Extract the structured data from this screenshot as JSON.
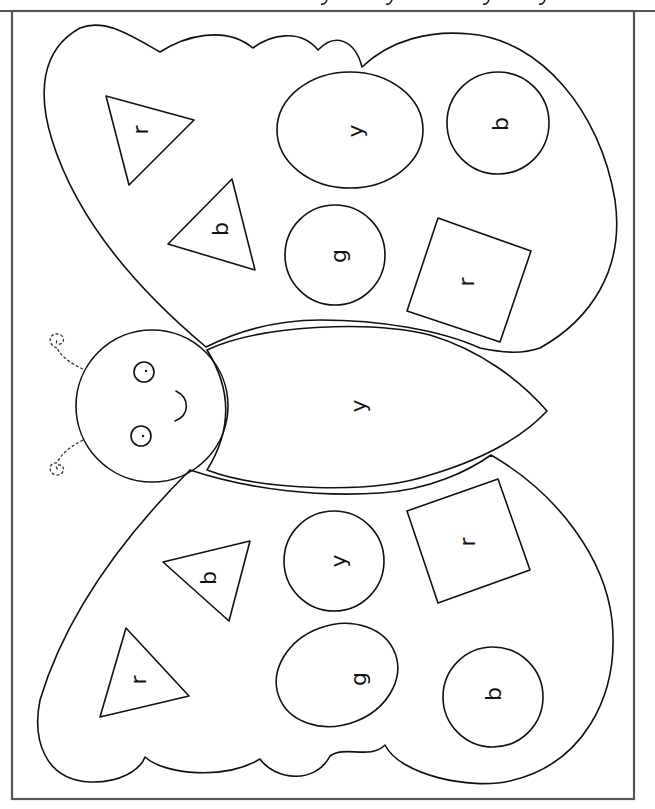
{
  "worksheet": {
    "title": "Butterfly color-by-letter",
    "frame_color": "#555555",
    "line_color": "#111111",
    "letters": {
      "upper_wing": {
        "triangle_1": "r",
        "triangle_2": "b",
        "oval_1": "y",
        "circle_1": "g",
        "circle_2": "b",
        "square_1": "r"
      },
      "body": "y",
      "lower_wing": {
        "triangle_1": "b",
        "triangle_2": "r",
        "circle_1": "y",
        "oval_1": "g",
        "circle_2": "b",
        "square_1": "r"
      }
    },
    "legend_key": {
      "r": "red",
      "b": "blue",
      "y": "yellow",
      "g": "green"
    }
  }
}
